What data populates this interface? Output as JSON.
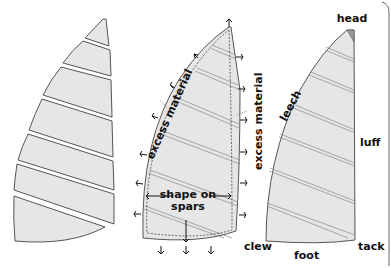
{
  "diagram": {
    "figures": [
      {
        "id": "cut-panels",
        "description": "Sail cut into separate panels"
      },
      {
        "id": "assembled-with-excess",
        "description": "Assembled panels with excess material trimmed to shape on spars"
      },
      {
        "id": "finished-sail",
        "description": "Finished sail with edge and corner names"
      }
    ],
    "labels": {
      "excess_left": "excess material",
      "excess_right": "excess material",
      "shape_line1": "shape on",
      "shape_line2": "spars",
      "head": "head",
      "leech": "leech",
      "luff": "luff",
      "clew": "clew",
      "foot": "foot",
      "tack": "tack"
    },
    "colors": {
      "panel_fill": "#e6e6e6",
      "outline": "#555555",
      "text": "#111111"
    }
  }
}
